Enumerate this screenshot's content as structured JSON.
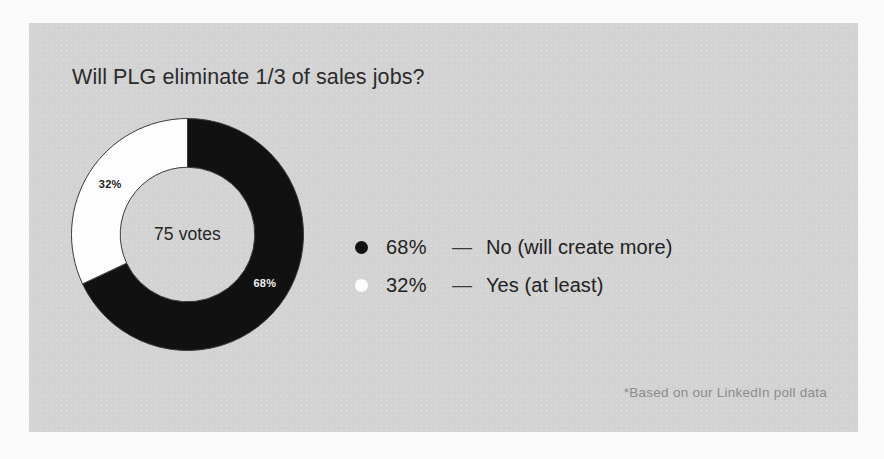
{
  "card": {
    "title": "Will PLG eliminate 1/3 of sales jobs?",
    "footnote": "*Based on our LinkedIn poll data",
    "background_color": "#d3d3d3",
    "page_background_color": "#fafafa"
  },
  "donut": {
    "center_label": "75 votes",
    "slice_label_primary": "68%",
    "slice_label_secondary": "32%"
  },
  "legend": {
    "rows": [
      {
        "dot": "legend-dot-black",
        "percent": "68%",
        "dash": "—",
        "label": "No (will create more)",
        "color": "#111111"
      },
      {
        "dot": "legend-dot-white",
        "percent": "32%",
        "dash": "—",
        "label": "Yes (at least)",
        "color": "#fdfdfd"
      }
    ]
  },
  "chart_data": {
    "type": "pie",
    "title": "Will PLG eliminate 1/3 of sales jobs?",
    "subtitle": "",
    "xlabel": "",
    "ylabel": "",
    "total_label": "75 votes",
    "total_votes": 75,
    "units": "percent",
    "donut": true,
    "inner_radius_ratio": 0.58,
    "start_angle_deg": 0,
    "direction": "clockwise",
    "legend_position": "right",
    "grid": false,
    "annotation": "*Based on our LinkedIn poll data",
    "categories": [
      "No (will create more)",
      "Yes (at least)"
    ],
    "values": [
      68,
      32
    ],
    "labels": [
      "68%",
      "32%"
    ],
    "colors": [
      "#111111",
      "#fdfdfd"
    ],
    "slices": [
      {
        "name": "No (will create more)",
        "value": 68,
        "label": "68%",
        "color": "#111111",
        "label_color": "#f2f2f2",
        "votes": 51
      },
      {
        "name": "Yes (at least)",
        "value": 32,
        "label": "32%",
        "color": "#fdfdfd",
        "label_color": "#222222",
        "votes": 24
      }
    ]
  }
}
